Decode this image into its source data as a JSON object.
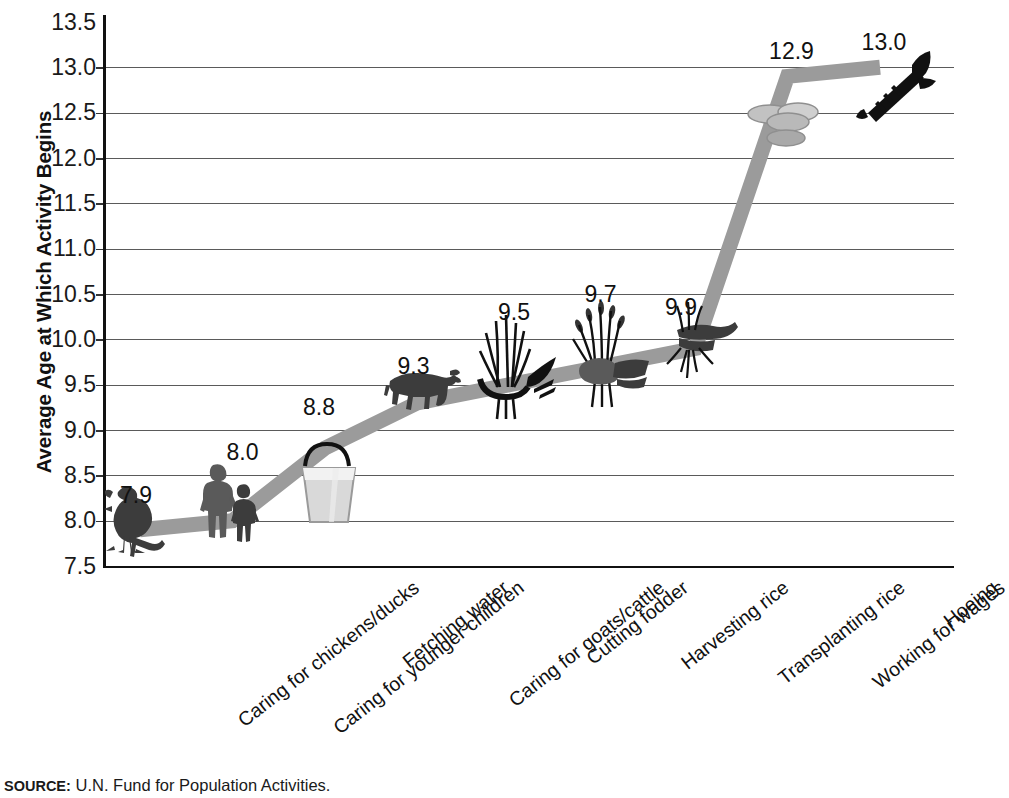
{
  "chart_data": {
    "type": "line",
    "title": "",
    "xlabel": "",
    "ylabel": "Average Age at Which Activity Begins",
    "ylim": [
      7.5,
      13.5
    ],
    "ytick_step": 0.5,
    "grid": true,
    "legend": "none",
    "categories": [
      "Caring for chickens/ducks",
      "Caring for younger children",
      "Fetching water",
      "Caring for goats/cattle",
      "Cutting fodder",
      "Harvesting rice",
      "Transplanting rice",
      "Working for wages",
      "Hoeing"
    ],
    "values": [
      7.9,
      8.0,
      8.8,
      9.3,
      9.5,
      9.7,
      9.9,
      12.9,
      13.0
    ],
    "point_labels": [
      "7.9",
      "8.0",
      "8.8",
      "9.3",
      "9.5",
      "9.7",
      "9.9",
      "12.9",
      "13.0"
    ],
    "ytick_labels": [
      "13.5",
      "13.0",
      "12.5",
      "12.0",
      "11.5",
      "11.0",
      "10.5",
      "10.0",
      "9.5",
      "9.0",
      "8.5",
      "8.0",
      "7.5"
    ],
    "ytick_values": [
      13.5,
      13.0,
      12.5,
      12.0,
      11.5,
      11.0,
      10.5,
      10.0,
      9.5,
      9.0,
      8.5,
      8.0,
      7.5
    ],
    "series_color": "#9b9b9b",
    "grid_color": "#5a5a5a",
    "axis_color": "#111111",
    "icon_color": "#5a5a5a",
    "icons": [
      "chicken-icon",
      "children-icon",
      "water-bucket-icon",
      "cattle-icon",
      "fodder-sickle-icon",
      "rice-sheaf-icon",
      "rice-seedling-icon",
      "coins-icon",
      "hoe-icon"
    ]
  },
  "axis": {
    "y_title": "Average Age at Which Activity Begins"
  },
  "source": {
    "label": "SOURCE:",
    "text": "U.N. Fund for Population Activities."
  }
}
